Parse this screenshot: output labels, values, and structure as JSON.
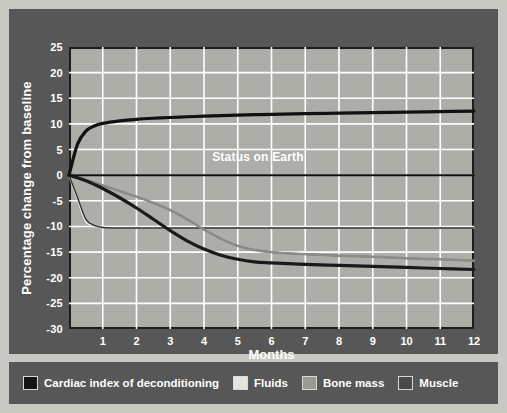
{
  "chart_data": {
    "type": "line",
    "title": "",
    "xlabel": "Months",
    "ylabel": "Percentage change from baseline",
    "xlim": [
      0,
      12
    ],
    "ylim": [
      -30,
      25
    ],
    "grid": true,
    "legend_position": "bottom",
    "annotations": [
      {
        "text": "Status on Earth",
        "x": 5.6,
        "y": 2.2
      }
    ],
    "baseline": {
      "value": 0,
      "label": "Status on Earth"
    },
    "xticks": [
      "1",
      "2",
      "3",
      "4",
      "5",
      "6",
      "7",
      "8",
      "9",
      "10",
      "11",
      "12"
    ],
    "yticks": [
      "25",
      "20",
      "15",
      "10",
      "5",
      "0",
      "-5",
      "-10",
      "-15",
      "-20",
      "-25",
      "-30"
    ],
    "x": [
      0,
      0.25,
      0.5,
      0.75,
      1,
      1.5,
      2,
      2.5,
      3,
      3.5,
      4,
      4.5,
      5,
      5.5,
      6,
      7,
      8,
      9,
      10,
      11,
      12
    ],
    "series": [
      {
        "name": "Cardiac index of deconditioning",
        "color": "#111111",
        "width": 3.2,
        "values": [
          0,
          6.0,
          8.6,
          9.6,
          10.1,
          10.6,
          10.9,
          11.1,
          11.25,
          11.4,
          11.5,
          11.6,
          11.7,
          11.8,
          11.85,
          12.0,
          12.1,
          12.2,
          12.3,
          12.4,
          12.5
        ]
      },
      {
        "name": "Fluids",
        "color": "#e8e8e4",
        "width": 2.0,
        "values": [
          0,
          -4.6,
          -9.0,
          -9.9,
          -10.2,
          -10.3,
          -10.3,
          -10.3,
          -10.3,
          -10.3,
          -10.3,
          -10.3,
          -10.3,
          -10.3,
          -10.3,
          -10.3,
          -10.3,
          -10.3,
          -10.3,
          -10.3,
          -10.3
        ]
      },
      {
        "name": "Bone mass",
        "color": "#8d8d88",
        "width": 2.4,
        "values": [
          0,
          -0.4,
          -0.9,
          -1.4,
          -2.0,
          -3.1,
          -4.2,
          -5.4,
          -6.8,
          -8.6,
          -10.6,
          -12.4,
          -13.8,
          -14.6,
          -15.0,
          -15.4,
          -15.7,
          -15.9,
          -16.2,
          -16.4,
          -16.7
        ]
      },
      {
        "name": "Muscle",
        "color": "#2b2b2b",
        "width": 1.4,
        "values": [
          0,
          -4.3,
          -8.6,
          -9.8,
          -10.2,
          -10.3,
          -10.3,
          -10.3,
          -10.3,
          -10.3,
          -10.3,
          -10.3,
          -10.3,
          -10.3,
          -10.3,
          -10.3,
          -10.3,
          -10.3,
          -10.3,
          -10.3,
          -10.3
        ]
      },
      {
        "name": "Muscle mass loss",
        "color": "#1a1a1a",
        "width": 3.2,
        "values": [
          0,
          -0.5,
          -1.1,
          -1.8,
          -2.6,
          -4.4,
          -6.4,
          -8.6,
          -10.8,
          -12.8,
          -14.4,
          -15.6,
          -16.4,
          -16.9,
          -17.1,
          -17.4,
          -17.6,
          -17.8,
          -18.0,
          -18.2,
          -18.4
        ]
      },
      {
        "name": "Bone secondary",
        "color": "#3a3a3a",
        "width": 1.6,
        "values": [
          0,
          -0.4,
          -0.9,
          -1.4,
          -2.0,
          -3.1,
          -4.2,
          -5.4,
          -6.8,
          -8.6,
          -10.6,
          -12.4,
          -13.8,
          -14.6,
          -15.0,
          -15.4,
          -15.7,
          -15.9,
          -16.2,
          -16.4,
          -16.7
        ]
      },
      {
        "name": "Earth baseline",
        "color": "#111111",
        "width": 2.0,
        "values": [
          0,
          0,
          0,
          0,
          0,
          0,
          0,
          0,
          0,
          0,
          0,
          0,
          0,
          0,
          0,
          0,
          0,
          0,
          0,
          0,
          0
        ]
      }
    ]
  },
  "legend": {
    "items": [
      {
        "label": "Cardiac index of deconditioning",
        "color": "#151515"
      },
      {
        "label": "Fluids",
        "color": "#e4e4e0"
      },
      {
        "label": "Bone mass",
        "color": "#9a9a95"
      },
      {
        "label": "Muscle",
        "color": "#4a4a4a"
      }
    ]
  },
  "colors": {
    "page_background": "#c9c9c4",
    "panel_background": "#575757",
    "plot_background": "#aeaea9",
    "grid": "#ffffff",
    "axis": "#1d1d1d",
    "text": "#ffffff"
  }
}
